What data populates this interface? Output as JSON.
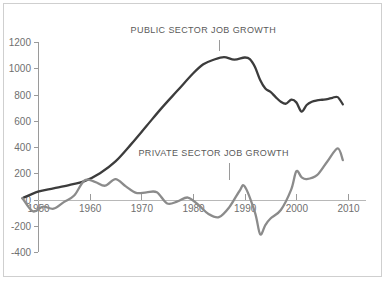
{
  "chart_data": {
    "type": "line",
    "title": "",
    "xlabel": "",
    "ylabel": "",
    "xlim": [
      1947,
      2010
    ],
    "ylim": [
      -400,
      1200
    ],
    "grid": false,
    "legend_position": "inline-annotation",
    "x_ticks": [
      "1950",
      "1960",
      "1970",
      "1980",
      "1990",
      "2000",
      "2010"
    ],
    "x_tick_values": [
      1950,
      1960,
      1970,
      1980,
      1990,
      2000,
      2010
    ],
    "y_ticks": [
      "1200",
      "1000",
      "800",
      "600",
      "400",
      "200",
      "0",
      "-200",
      "-400"
    ],
    "y_tick_values": [
      1200,
      1000,
      800,
      600,
      400,
      200,
      0,
      -200,
      -400
    ],
    "series": [
      {
        "name": "PUBLIC SECTOR JOB GROWTH",
        "color": "#3c3c3c",
        "stroke_width": 2.3,
        "label_x": 1982,
        "label_y": 1270,
        "leader_x": 1985,
        "leader_y_top": 1215,
        "leader_y_bottom": 1130,
        "x": [
          1947,
          1950,
          1953,
          1956,
          1959,
          1962,
          1965,
          1968,
          1971,
          1974,
          1977,
          1980,
          1982,
          1984,
          1986,
          1988,
          1990,
          1991,
          1992,
          1993,
          1994,
          1995,
          1996,
          1997,
          1998,
          1999,
          2000,
          2001,
          2002,
          2003,
          2004,
          2005,
          2006,
          2007,
          2008,
          2009
        ],
        "y": [
          10,
          60,
          85,
          110,
          140,
          200,
          290,
          420,
          560,
          700,
          830,
          960,
          1030,
          1065,
          1085,
          1065,
          1082,
          1070,
          1010,
          910,
          845,
          820,
          780,
          745,
          730,
          760,
          740,
          670,
          720,
          745,
          755,
          760,
          765,
          775,
          780,
          725
        ]
      },
      {
        "name": "PRIVATE SECTOR JOB GROWTH",
        "color": "#8b8b8b",
        "stroke_width": 2.3,
        "label_x": 1984,
        "label_y": 330,
        "leader_x": 1987,
        "leader_y_top": 280,
        "leader_y_bottom": 150,
        "x": [
          1947,
          1949,
          1951,
          1953,
          1955,
          1957,
          1959,
          1961,
          1963,
          1965,
          1967,
          1969,
          1971,
          1973,
          1975,
          1977,
          1979,
          1981,
          1983,
          1985,
          1987,
          1989,
          1990,
          1992,
          1993,
          1994,
          1995,
          1997,
          1999,
          2000,
          2001,
          2002,
          2004,
          2006,
          2008,
          2009
        ],
        "y": [
          10,
          -90,
          -55,
          -70,
          -20,
          30,
          145,
          135,
          105,
          155,
          100,
          50,
          55,
          55,
          -30,
          -15,
          15,
          -40,
          -110,
          -135,
          -60,
          65,
          100,
          -100,
          -265,
          -195,
          -145,
          -80,
          75,
          215,
          170,
          155,
          185,
          290,
          390,
          300
        ]
      }
    ],
    "annotations": [
      {
        "text": "PUBLIC SECTOR JOB GROWTH"
      },
      {
        "text": "PRIVATE SECTOR JOB GROWTH"
      }
    ],
    "colors": {
      "public": "#3c3c3c",
      "private": "#8b8b8b",
      "axis": "#9a9a9a",
      "zero_line": "#b8b8b8",
      "frame": "#cfcfcf",
      "text": "#6f6f6f",
      "background": "#ffffff"
    }
  }
}
